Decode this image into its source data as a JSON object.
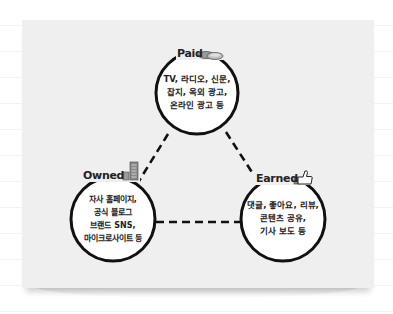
{
  "diagram": {
    "title": "",
    "colors": {
      "paper": "#efefef",
      "stroke": "#111111",
      "circle_fill": "#ffffff",
      "icon_grey": "#8a8a8a"
    },
    "nodes": [
      {
        "id": "paid",
        "label": "Paid",
        "icon": "coins-icon",
        "lines": [
          "TV, 라디오, 신문,",
          "잡지, 옥외 광고,",
          "온라인 광고 등"
        ]
      },
      {
        "id": "owned",
        "label": "Owned",
        "icon": "building-icon",
        "lines": [
          "자사 홈페이지,",
          "공식 블로그",
          "브랜드 SNS,",
          "마이크로사이트 등"
        ]
      },
      {
        "id": "earned",
        "label": "Earned",
        "icon": "thumbs-up-icon",
        "lines": [
          "댓글, 좋아요, 리뷰,",
          "콘텐츠 공유,",
          "기사 보도 등"
        ]
      }
    ],
    "edges": [
      {
        "from": "paid",
        "to": "owned",
        "style": "dashed"
      },
      {
        "from": "paid",
        "to": "earned",
        "style": "dashed"
      },
      {
        "from": "owned",
        "to": "earned",
        "style": "dashed"
      }
    ]
  }
}
